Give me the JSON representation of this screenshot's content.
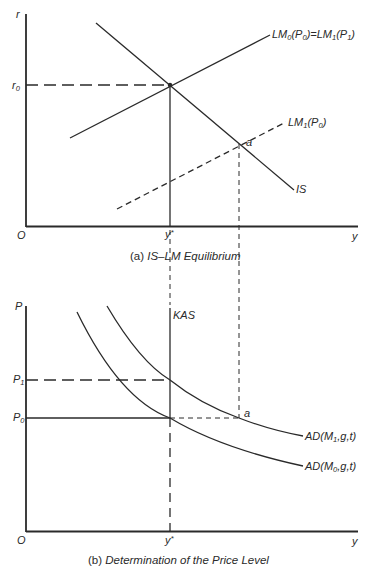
{
  "panel_a": {
    "caption_prefix": "(a) ",
    "caption_title": "IS–LM Equilibrium",
    "y_axis_label": "r",
    "x_axis_label": "y",
    "origin_label": "O",
    "r0_label": "r",
    "r0_sub": "0",
    "ystar_label": "y",
    "ystar_sup": "*",
    "curves": {
      "LM0": {
        "label_main": "LM",
        "sub1": "0",
        "paren_open": "(P",
        "sub2": "0",
        "eq": ")=LM",
        "sub3": "1",
        "paren_open2": "(P",
        "sub4": "1",
        "close": ")"
      },
      "LM1": {
        "label_main": "LM",
        "sub1": "1",
        "paren_open": "(P",
        "sub2": "0",
        "close": ")"
      },
      "IS": {
        "label": "IS"
      }
    },
    "point_a_label": "a"
  },
  "panel_b": {
    "caption_prefix": "(b) ",
    "caption_title": "Determination of the Price Level",
    "y_axis_label": "P",
    "x_axis_label": "y",
    "origin_label": "O",
    "p1_label": "P",
    "p1_sub": "1",
    "p0_label": "P",
    "p0_sub": "0",
    "ystar_label": "y",
    "ystar_sup": "*",
    "kas_label": "KAS",
    "curves": {
      "AD1": {
        "label_main": "AD(M",
        "sub": "1",
        "rest": ",g,t)"
      },
      "AD0": {
        "label_main": "AD(M",
        "sub": "0",
        "rest": ",g,t)"
      }
    },
    "point_a_label": "a"
  },
  "colors": {
    "line": "#2a2a2a",
    "background": "#ffffff"
  }
}
